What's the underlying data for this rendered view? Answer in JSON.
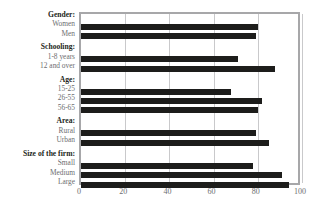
{
  "chart_data": {
    "type": "bar",
    "orientation": "horizontal",
    "title": "",
    "xlabel": "",
    "ylabel": "",
    "xlim": [
      0,
      100
    ],
    "xticks": [
      0,
      20,
      40,
      60,
      80,
      100
    ],
    "grid": true,
    "legend": false,
    "bar_color": "#1d1d1b",
    "groups": [
      {
        "name": "Gender:",
        "items": [
          {
            "label": "Women",
            "value": 80
          },
          {
            "label": "Men",
            "value": 79
          }
        ]
      },
      {
        "name": "Schooling:",
        "items": [
          {
            "label": "1-8 years",
            "value": 71
          },
          {
            "label": "12 and over",
            "value": 88
          }
        ]
      },
      {
        "name": "Age:",
        "items": [
          {
            "label": "15-25",
            "value": 68
          },
          {
            "label": "26-55",
            "value": 82
          },
          {
            "label": "56-65",
            "value": 80
          }
        ]
      },
      {
        "name": "Area:",
        "items": [
          {
            "label": "Rural",
            "value": 79
          },
          {
            "label": "Urban",
            "value": 85
          }
        ]
      },
      {
        "name": "Size of the firm:",
        "items": [
          {
            "label": "Small",
            "value": 78
          },
          {
            "label": "Medium",
            "value": 91
          },
          {
            "label": "Large",
            "value": 94
          }
        ]
      }
    ],
    "categories": [
      "Women",
      "Men",
      "1-8 years",
      "12 and over",
      "15-25",
      "26-55",
      "56-65",
      "Rural",
      "Urban",
      "Small",
      "Medium",
      "Large"
    ],
    "values": [
      80,
      79,
      71,
      88,
      68,
      82,
      80,
      79,
      85,
      78,
      91,
      94
    ]
  },
  "axis": {
    "x_tick_labels": [
      "0",
      "20",
      "40",
      "60",
      "80",
      "100"
    ]
  },
  "colors": {
    "bar": "#1d1d1b",
    "frame": "#a7a7a9",
    "grid": "#c9c9cb",
    "group_label": "#231f20",
    "item_label": "#6d6e70",
    "background": "#ffffff"
  }
}
